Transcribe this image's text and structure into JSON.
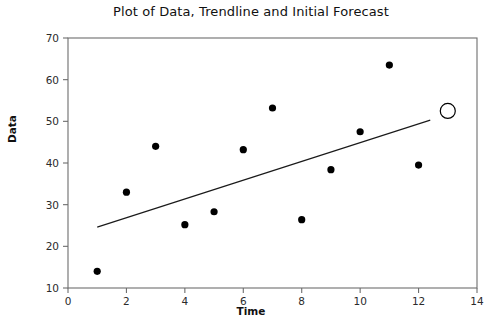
{
  "chart_data": {
    "type": "scatter",
    "title": "Plot of Data, Trendline and Initial Forecast",
    "xlabel": "Time",
    "ylabel": "Data",
    "xlim": [
      0,
      14
    ],
    "ylim": [
      10,
      70
    ],
    "xticks": [
      0,
      2,
      4,
      6,
      8,
      10,
      12,
      14
    ],
    "yticks": [
      10,
      20,
      30,
      40,
      50,
      60,
      70
    ],
    "grid": false,
    "legend": "none",
    "series": [
      {
        "name": "Data",
        "marker": "filled-circle",
        "color": "#000000",
        "x": [
          1,
          2,
          3,
          4,
          5,
          6,
          7,
          8,
          9,
          10,
          11,
          12
        ],
        "values": [
          14.0,
          33.0,
          44.0,
          25.2,
          28.3,
          43.2,
          53.2,
          26.4,
          38.4,
          47.5,
          63.5,
          39.5
        ]
      },
      {
        "name": "Initial Forecast",
        "marker": "open-circle",
        "color": "#000000",
        "x": [
          13
        ],
        "values": [
          52.5
        ]
      }
    ],
    "trendline": {
      "name": "Trendline",
      "color": "#1a1a1a",
      "x_start": 1.0,
      "y_start": 24.6,
      "x_end": 12.4,
      "y_end": 50.3
    }
  },
  "axis": {
    "x_tick_labels": [
      "0",
      "2",
      "4",
      "6",
      "8",
      "10",
      "12",
      "14"
    ],
    "y_tick_labels": [
      "10",
      "20",
      "30",
      "40",
      "50",
      "60",
      "70"
    ]
  }
}
